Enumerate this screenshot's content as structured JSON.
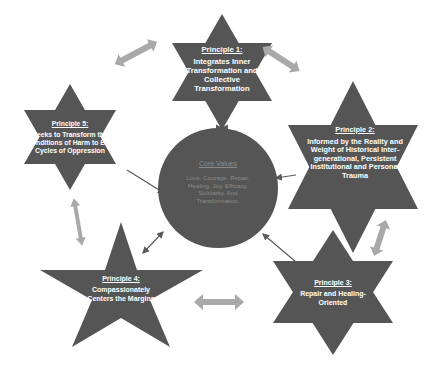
{
  "diagram": {
    "center": {
      "title": "Core Values",
      "body": "Love, Courage, Repair, Healing, Joy, Efficacy, Solidarity, And Transformation."
    },
    "principles": [
      {
        "id": "p1",
        "title": "Principle 1:",
        "body": "Integrates Inner Transformation and Collective Transformation"
      },
      {
        "id": "p2",
        "title": "Principle 2:",
        "body": "Informed by the Reality and Weight of Historical Inter-generational, Persistent Institutional and Personal Trauma"
      },
      {
        "id": "p3",
        "title": "Principle 3:",
        "body": "Repair and Healing-Oriented"
      },
      {
        "id": "p4",
        "title": "Principle 4:",
        "body": "Compassionately Centers the Margins"
      },
      {
        "id": "p5",
        "title": "Principle 5:",
        "body": "Seeks to Transform the Conditions of Harm to End Cycles of Oppression"
      }
    ],
    "colors": {
      "shape_fill": "#555555",
      "arrow_fill": "#a9a9a9",
      "connector": "#5a5a5a",
      "text": "#ffffff",
      "center_text": "#8a8a8a"
    }
  }
}
